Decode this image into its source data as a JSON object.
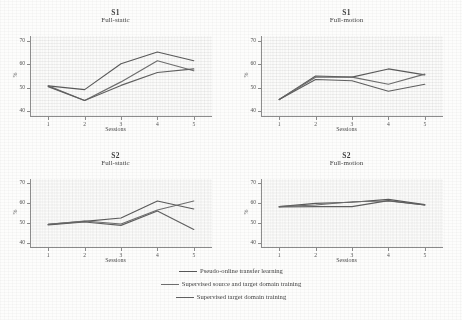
{
  "figure": {
    "background": "#fdfdfc",
    "series_colors": [
      "#5a5a5a",
      "#6e6e6e",
      "#606060"
    ],
    "axis_color": "#8d8d8d"
  },
  "legend": {
    "items": [
      {
        "label": "Pseudo-online transfer learning",
        "color": "#5a5a5a"
      },
      {
        "label": "Supervised source and target domain training",
        "color": "#6e6e6e"
      },
      {
        "label": "Supervised target domain training",
        "color": "#606060"
      }
    ]
  },
  "chart_data": [
    {
      "type": "line",
      "title": "S1",
      "subtitle": "Full-static",
      "xlabel": "Sessions",
      "ylabel": "%",
      "x": [
        1,
        2,
        3,
        4,
        5
      ],
      "xticklabels": [
        "1",
        "2",
        "3",
        "4",
        "5"
      ],
      "yticks": [
        40,
        50,
        60,
        70
      ],
      "yticklabels": [
        "40",
        "50",
        "60",
        "70"
      ],
      "ylim": [
        38,
        72
      ],
      "xlim": [
        0.5,
        5.5
      ],
      "grid": false,
      "legend_position": "below-figure",
      "series": [
        {
          "name": "Pseudo-online transfer learning",
          "values": [
            50.8,
            49.2,
            60.2,
            65.2,
            61.5
          ]
        },
        {
          "name": "Supervised source and target domain training",
          "values": [
            50.8,
            44.6,
            52.5,
            61.5,
            57.2
          ]
        },
        {
          "name": "Supervised target domain training",
          "values": [
            50.5,
            44.6,
            51.0,
            56.5,
            58.0
          ]
        }
      ]
    },
    {
      "type": "line",
      "title": "S1",
      "subtitle": "Full-motion",
      "xlabel": "Sessions",
      "ylabel": "%",
      "x": [
        1,
        2,
        3,
        4,
        5
      ],
      "xticklabels": [
        "1",
        "2",
        "3",
        "4",
        "5"
      ],
      "yticks": [
        40,
        50,
        60,
        70
      ],
      "yticklabels": [
        "40",
        "50",
        "60",
        "70"
      ],
      "ylim": [
        38,
        72
      ],
      "xlim": [
        0.5,
        5.5
      ],
      "grid": false,
      "legend_position": "below-figure",
      "series": [
        {
          "name": "Pseudo-online transfer learning",
          "values": [
            45.0,
            55.0,
            54.5,
            58.0,
            55.5
          ]
        },
        {
          "name": "Supervised source and target domain training",
          "values": [
            45.0,
            54.5,
            54.5,
            51.5,
            55.8
          ]
        },
        {
          "name": "Supervised target domain training",
          "values": [
            45.0,
            53.5,
            53.0,
            48.5,
            51.5
          ]
        }
      ]
    },
    {
      "type": "line",
      "title": "S2",
      "subtitle": "Full-static",
      "xlabel": "Sessions",
      "ylabel": "%",
      "x": [
        1,
        2,
        3,
        4,
        5
      ],
      "xticklabels": [
        "1",
        "2",
        "3",
        "4",
        "5"
      ],
      "yticks": [
        40,
        50,
        60,
        70
      ],
      "yticklabels": [
        "40",
        "50",
        "60",
        "70"
      ],
      "ylim": [
        38,
        72
      ],
      "xlim": [
        0.5,
        5.5
      ],
      "grid": false,
      "legend_position": "below-figure",
      "series": [
        {
          "name": "Pseudo-online transfer learning",
          "values": [
            49.3,
            50.8,
            52.5,
            61.0,
            57.0
          ]
        },
        {
          "name": "Supervised source and target domain training",
          "values": [
            49.3,
            51.0,
            49.5,
            56.5,
            61.0
          ]
        },
        {
          "name": "Supervised target domain training",
          "values": [
            49.0,
            50.5,
            48.8,
            56.0,
            46.8
          ]
        }
      ]
    },
    {
      "type": "line",
      "title": "S2",
      "subtitle": "Full-motion",
      "xlabel": "Sessions",
      "ylabel": "%",
      "x": [
        1,
        2,
        3,
        4,
        5
      ],
      "xticklabels": [
        "1",
        "2",
        "3",
        "4",
        "5"
      ],
      "yticks": [
        40,
        50,
        60,
        70
      ],
      "yticklabels": [
        "40",
        "50",
        "60",
        "70"
      ],
      "ylim": [
        38,
        72
      ],
      "xlim": [
        0.5,
        5.5
      ],
      "grid": false,
      "legend_position": "below-figure",
      "series": [
        {
          "name": "Pseudo-online transfer learning",
          "values": [
            58.2,
            59.8,
            60.4,
            61.8,
            59.2
          ]
        },
        {
          "name": "Supervised source and target domain training",
          "values": [
            58.2,
            59.0,
            60.6,
            61.0,
            59.0
          ]
        },
        {
          "name": "Supervised target domain training",
          "values": [
            58.0,
            58.2,
            58.2,
            61.2,
            59.0
          ]
        }
      ]
    }
  ]
}
